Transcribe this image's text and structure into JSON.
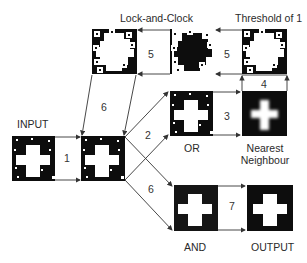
{
  "labels": {
    "input": "INPUT",
    "lock_and_clock": "Lock-and-Clock",
    "threshold": "Threshold of 1",
    "or": "OR",
    "nearest_neighbour_line1": "Nearest",
    "nearest_neighbour_line2": "Neighbour",
    "and": "AND",
    "output": "OUTPUT"
  },
  "steps": {
    "s1": "1",
    "s2": "2",
    "s3": "3",
    "s4": "4",
    "s5a": "5",
    "s5b": "5",
    "s6a": "6",
    "s6b": "6",
    "s7": "7"
  },
  "colors": {
    "image_bg": "#0d0d0d",
    "cross": "#ffffff",
    "line": "#333333",
    "text": "#2a2a2a"
  }
}
